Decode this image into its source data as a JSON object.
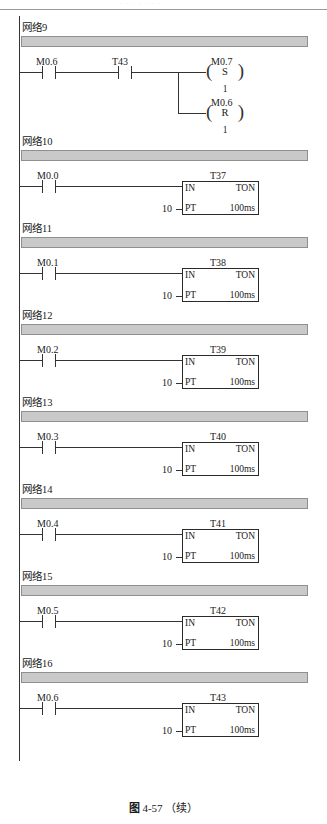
{
  "page": {
    "header_ghost": "· · · · · · ·",
    "caption_figure": "图",
    "caption_number": "4-57",
    "caption_suffix": "（续）"
  },
  "labels": {
    "in": "IN",
    "ton": "TON",
    "pt": "PT",
    "timebase": "100ms",
    "preset": "10",
    "set_char": "S",
    "reset_char": "R",
    "coil_count": "1",
    "paren_left": "(",
    "paren_right": ")"
  },
  "networks": [
    {
      "id": "net9",
      "title": "网络9",
      "type": "coil",
      "contacts": [
        {
          "name": "M0.6"
        },
        {
          "name": "T43"
        }
      ],
      "coils": [
        {
          "name": "M0.7",
          "op": "S",
          "count": "1"
        },
        {
          "name": "M0.6",
          "op": "R",
          "count": "1"
        }
      ]
    },
    {
      "id": "net10",
      "title": "网络10",
      "type": "timer",
      "contacts": [
        {
          "name": "M0.0"
        }
      ],
      "timer": {
        "name": "T37",
        "in": "IN",
        "mode": "TON",
        "pt": "PT",
        "preset": "10",
        "timebase": "100ms"
      }
    },
    {
      "id": "net11",
      "title": "网络11",
      "type": "timer",
      "contacts": [
        {
          "name": "M0.1"
        }
      ],
      "timer": {
        "name": "T38",
        "in": "IN",
        "mode": "TON",
        "pt": "PT",
        "preset": "10",
        "timebase": "100ms"
      }
    },
    {
      "id": "net12",
      "title": "网络12",
      "type": "timer",
      "contacts": [
        {
          "name": "M0.2"
        }
      ],
      "timer": {
        "name": "T39",
        "in": "IN",
        "mode": "TON",
        "pt": "PT",
        "preset": "10",
        "timebase": "100ms"
      }
    },
    {
      "id": "net13",
      "title": "网络13",
      "type": "timer",
      "contacts": [
        {
          "name": "M0.3"
        }
      ],
      "timer": {
        "name": "T40",
        "in": "IN",
        "mode": "TON",
        "pt": "PT",
        "preset": "10",
        "timebase": "100ms"
      }
    },
    {
      "id": "net14",
      "title": "网络14",
      "type": "timer",
      "contacts": [
        {
          "name": "M0.4"
        }
      ],
      "timer": {
        "name": "T41",
        "in": "IN",
        "mode": "TON",
        "pt": "PT",
        "preset": "10",
        "timebase": "100ms"
      }
    },
    {
      "id": "net15",
      "title": "网络15",
      "type": "timer",
      "contacts": [
        {
          "name": "M0.5"
        }
      ],
      "timer": {
        "name": "T42",
        "in": "IN",
        "mode": "TON",
        "pt": "PT",
        "preset": "10",
        "timebase": "100ms"
      }
    },
    {
      "id": "net16",
      "title": "网络16",
      "type": "timer",
      "contacts": [
        {
          "name": "M0.6"
        }
      ],
      "timer": {
        "name": "T43",
        "in": "IN",
        "mode": "TON",
        "pt": "PT",
        "preset": "10",
        "timebase": "100ms"
      }
    }
  ],
  "colors": {
    "bar_fill": "#c9c9c9",
    "bar_border": "#8f8f8f",
    "line": "#333333",
    "text": "#1a1a1a"
  }
}
